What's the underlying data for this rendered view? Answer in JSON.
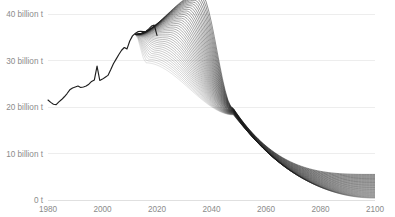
{
  "chart_data": {
    "type": "line",
    "title": "",
    "subtitle": "",
    "xlabel": "",
    "ylabel": "",
    "xlim": [
      1980,
      2100
    ],
    "ylim": [
      0,
      45
    ],
    "grid": true,
    "legend": false,
    "legend_position": "none",
    "units": "billion t CO2 per year",
    "y_ticks": [
      0,
      10,
      20,
      30,
      40
    ],
    "y_tick_labels": [
      "0 t",
      "10 billion t",
      "20 billion t",
      "30 billion t",
      "40 billion t"
    ],
    "x_ticks": [
      1980,
      2000,
      2020,
      2040,
      2060,
      2080,
      2100
    ],
    "x_tick_labels": [
      "1980",
      "2000",
      "2020",
      "2040",
      "2060",
      "2080",
      "2100"
    ],
    "colors": {
      "line": "#1a1a1a",
      "history": "#1f1f1f",
      "grid": "#e8e8e8",
      "axis": "#d8d8d8",
      "text": "#8b8b8b",
      "background": "#ffffff"
    },
    "history": {
      "name": "Historical emissions",
      "x": [
        1980,
        1981,
        1982,
        1983,
        1984,
        1985,
        1986,
        1987,
        1988,
        1989,
        1990,
        1991,
        1992,
        1993,
        1994,
        1995,
        1996,
        1997,
        1998,
        1999,
        2000,
        2001,
        2002,
        2003,
        2004,
        2005,
        2006,
        2007,
        2008,
        2009,
        2010,
        2011,
        2012,
        2013,
        2014,
        2015,
        2016,
        2017,
        2018,
        2019,
        2020
      ],
      "y": [
        21.5,
        21.0,
        20.6,
        20.5,
        21.1,
        21.6,
        22.2,
        22.9,
        23.7,
        24.1,
        24.3,
        24.5,
        24.2,
        24.3,
        24.5,
        24.9,
        25.5,
        25.8,
        28.8,
        25.7,
        26.0,
        26.4,
        26.8,
        28.0,
        29.3,
        30.3,
        31.3,
        32.2,
        32.8,
        32.5,
        34.2,
        35.3,
        35.8,
        36.2,
        36.3,
        36.2,
        36.3,
        36.8,
        37.4,
        37.6,
        35.4
      ]
    },
    "scenarios": {
      "count": 40,
      "description": "Scenario ensemble fanning out from 2020, peaking 2015-2035, declining to near zero by 2100",
      "peak_year_range": [
        2016,
        2036
      ],
      "peak_value_range": [
        29.5,
        44.5
      ],
      "end_year": 2100,
      "end_value_range": [
        0.4,
        5.5
      ],
      "convergence_year": 2048,
      "convergence_value": 19.0
    }
  },
  "axis": {
    "y_label_0": "0 t",
    "y_label_10": "10 billion t",
    "y_label_20": "20 billion t",
    "y_label_30": "30 billion t",
    "y_label_40": "40 billion t",
    "x_label_1980": "1980",
    "x_label_2000": "2000",
    "x_label_2020": "2020",
    "x_label_2040": "2040",
    "x_label_2060": "2060",
    "x_label_2080": "2080",
    "x_label_2100": "2100"
  }
}
